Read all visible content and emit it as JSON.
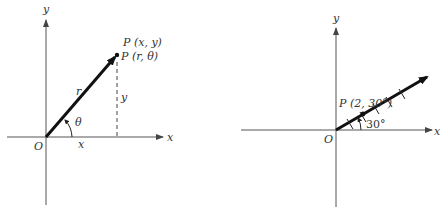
{
  "figures": [
    {
      "id": "left",
      "description": "Point P with rectangular coordinates (x, y) and polar coordinates (r, θ)",
      "axis_labels": {
        "x": "x",
        "y": "y"
      },
      "origin_label": "O",
      "point_labels": [
        "P (x, y)",
        "P (r, θ)"
      ],
      "segment_labels": {
        "radius": "r",
        "horizontal": "x",
        "vertical": "y"
      },
      "angle_label": "θ"
    },
    {
      "id": "right",
      "description": "Plotting the polar point P(2, 30°)",
      "axis_labels": {
        "x": "x",
        "y": "y"
      },
      "origin_label": "O",
      "point_label": "P (2, 30°)",
      "angle_label": "30°",
      "tick_marks_on_ray": 5
    }
  ],
  "colors": {
    "ink": "#1a1a1a",
    "axis": "#555555",
    "text": "#333333",
    "background": "#ffffff"
  }
}
